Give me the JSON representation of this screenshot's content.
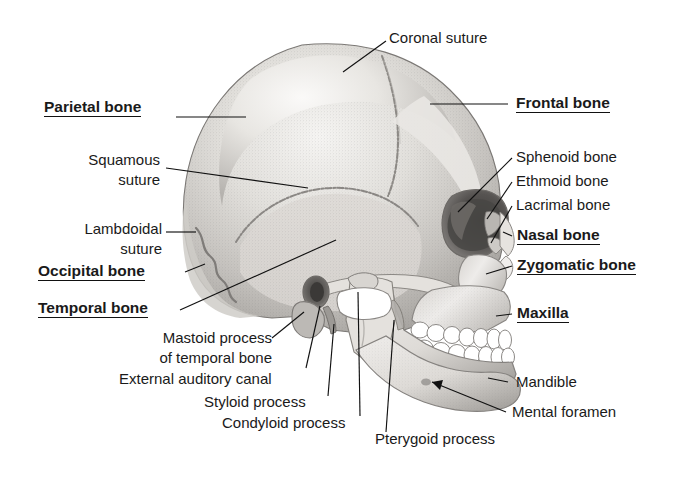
{
  "figure": {
    "background_color": "#ffffff",
    "text_color": "#1a1a1a",
    "leader_line_color": "#111111",
    "bone_light": "#f2f0ee",
    "bone_mid": "#c9c6c2",
    "bone_dark": "#8e8b87",
    "orbit_dark": "#4a4846",
    "tooth_color": "#ffffff"
  },
  "labels": {
    "coronal_suture": {
      "text": "Coronal suture",
      "emphasis": "plain"
    },
    "parietal_bone": {
      "text": "Parietal bone",
      "emphasis": "bold-underline"
    },
    "frontal_bone": {
      "text": "Frontal bone",
      "emphasis": "bold-underline"
    },
    "squamous_suture": {
      "line1": "Squamous",
      "line2": "suture",
      "emphasis": "plain"
    },
    "lambdoidal_suture": {
      "line1": "Lambdoidal",
      "line2": "suture",
      "emphasis": "plain"
    },
    "sphenoid_bone": {
      "text": "Sphenoid bone",
      "emphasis": "plain"
    },
    "ethmoid_bone": {
      "text": "Ethmoid bone",
      "emphasis": "plain"
    },
    "lacrimal_bone": {
      "text": "Lacrimal bone",
      "emphasis": "plain"
    },
    "nasal_bone": {
      "text": "Nasal bone",
      "emphasis": "bold-underline"
    },
    "occipital_bone": {
      "text": "Occipital bone",
      "emphasis": "bold-underline"
    },
    "zygomatic_bone": {
      "text": "Zygomatic bone",
      "emphasis": "bold-underline"
    },
    "temporal_bone": {
      "text": "Temporal bone",
      "emphasis": "bold-underline"
    },
    "maxilla": {
      "text": "Maxilla",
      "emphasis": "bold-underline"
    },
    "mastoid_process": {
      "line1": "Mastoid process",
      "line2": "of temporal bone",
      "emphasis": "plain"
    },
    "external_auditory_canal": {
      "text": "External auditory canal",
      "emphasis": "plain"
    },
    "styloid_process": {
      "text": "Styloid process",
      "emphasis": "plain"
    },
    "condyloid_process": {
      "text": "Condyloid process",
      "emphasis": "plain"
    },
    "pterygoid_process": {
      "text": "Pterygoid process",
      "emphasis": "plain"
    },
    "mandible": {
      "text": "Mandible",
      "emphasis": "plain"
    },
    "mental_foramen": {
      "text": "Mental foramen",
      "emphasis": "plain"
    }
  }
}
